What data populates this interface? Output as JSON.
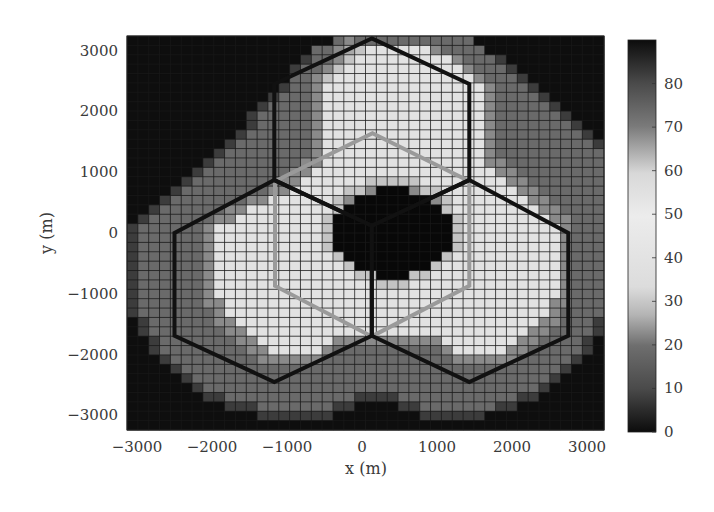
{
  "chart_data": {
    "type": "heatmap",
    "title": "",
    "xlabel": "x (m)",
    "ylabel": "y (m)",
    "xlim": [
      -3200,
      3200
    ],
    "ylim": [
      -3200,
      3200
    ],
    "x_ticks": [
      -3000,
      -2000,
      -1000,
      0,
      1000,
      2000,
      3000
    ],
    "y_ticks": [
      -3000,
      -2000,
      -1000,
      0,
      1000,
      2000,
      3000
    ],
    "x_tick_labels": [
      "−3000",
      "−2000",
      "−1000",
      "0",
      "1000",
      "2000",
      "3000"
    ],
    "y_tick_labels": [
      "−3000",
      "−2000",
      "−1000",
      "0",
      "1000",
      "2000",
      "3000"
    ],
    "grid": true,
    "colorbar": {
      "min": 0,
      "max": 90,
      "ticks": [
        0,
        10,
        20,
        30,
        40,
        50,
        60,
        70,
        80
      ],
      "tick_labels": [
        "0",
        "10",
        "20",
        "30",
        "40",
        "50",
        "60",
        "70",
        "80"
      ],
      "colormap_description": "dark at 0, gray at 10-20, light at 30-60, gray at 70-80, dark at 90"
    },
    "grid_size": {
      "cols": 44,
      "rows": 42
    },
    "cell_value_legend": {
      "0": 0,
      "1": 8,
      "2": 14,
      "3": 20,
      "4": 26,
      "5": 35,
      "6": 45,
      "7": 55,
      "8": 72,
      "9": 90
    },
    "cell_rows_top_to_bottom": [
      "00000000000000000002322222222222000000000000",
      "00000000000000000223456666663222200000000000",
      "00000000000000001223566666666632221000000000",
      "00000000000000012235666666666663222100000000",
      "00000000000000022356666666666666322210000000",
      "00000000000000122366666666666666632221000000",
      "00000000000001222366666666666666632222100000",
      "00000000000012222366666666666666632222210000",
      "00000000000122222366666666666666632222221000",
      "00000000000122222366666666666666632222222100",
      "00000000001222222366666666666666632222222210",
      "00000000012222222366666666666666632222222221",
      "00000000122222222366666666666666632222222222",
      "00000001222222223366666666666666633222222222",
      "00000012222222233666666666666666663322222222",
      "00000122222222336666665555566666666332222222",
      "00001222222223366666553999355666666633222222",
      "00012222222336666665399999993566666663322222",
      "00122222233666666665999999999566666666332222",
      "01222222336666666659999999999956666666633222",
      "12222223666666666659999999999956666666663222",
      "12222223666666666659999999999956666666663222",
      "12222223666666666659999999999956666666663222",
      "12222223666666666665999999999566666666663222",
      "12222223666666666666599999995666666666663222",
      "12222223666666666666655999556666666666663222",
      "12222223666666666666666555666666666666663222",
      "12222223666666666666666666666666666666663222",
      "12222223366666666666666666666666666666633222",
      "12222222366666666666666666666666666666632222",
      "01222222336666666666666666666666666666332221",
      "01222222233666666666666666666666666663322221",
      "00122222223366666663333333333666666633222210",
      "00122222222336666632222222222366666332222210",
      "00012222222233333322222222222233333322222100",
      "00001222222222222222222222222222222222221000",
      "00000122222222222222222222222222222222210000",
      "00000012222222222222222222222222222222100000",
      "00000001122222222222211112222222222211000000",
      "00000000011122222221100001122222221100000000",
      "00000000000011111110000000011111100000000000",
      "00000000000000000000000000000000000000000000"
    ],
    "overlays": {
      "black_hexagons_m": [
        {
          "name": "top",
          "vertices": [
            [
              130,
              3200
            ],
            [
              1430,
              2450
            ],
            [
              1430,
              870
            ],
            [
              130,
              120
            ],
            [
              -1170,
              870
            ],
            [
              -1170,
              2450
            ]
          ]
        },
        {
          "name": "left",
          "vertices": [
            [
              -1170,
              870
            ],
            [
              130,
              120
            ],
            [
              130,
              -1690
            ],
            [
              -1170,
              -2450
            ],
            [
              -2500,
              -1690
            ],
            [
              -2500,
              0
            ]
          ]
        },
        {
          "name": "right",
          "vertices": [
            [
              1430,
              870
            ],
            [
              2750,
              0
            ],
            [
              2750,
              -1690
            ],
            [
              1430,
              -2450
            ],
            [
              130,
              -1690
            ],
            [
              130,
              120
            ]
          ]
        }
      ],
      "gray_hexagon_m": {
        "vertices": [
          [
            140,
            1640
          ],
          [
            1430,
            850
          ],
          [
            1430,
            -870
          ],
          [
            130,
            -1700
          ],
          [
            -1160,
            -870
          ],
          [
            -1160,
            850
          ]
        ]
      }
    }
  },
  "colorbar_stops": [
    {
      "offset": 0.0,
      "color": "#0c0c0c"
    },
    {
      "offset": 0.11,
      "color": "#4a4a4a"
    },
    {
      "offset": 0.22,
      "color": "#6e6e6e"
    },
    {
      "offset": 0.3,
      "color": "#b5b5b5"
    },
    {
      "offset": 0.37,
      "color": "#dcdcdc"
    },
    {
      "offset": 0.55,
      "color": "#ececec"
    },
    {
      "offset": 0.66,
      "color": "#d8d8d8"
    },
    {
      "offset": 0.78,
      "color": "#7a7a7a"
    },
    {
      "offset": 0.89,
      "color": "#4a4a4a"
    },
    {
      "offset": 1.0,
      "color": "#0c0c0c"
    }
  ],
  "level_colors": {
    "0": "#0e0e0e",
    "1": "#3c3c3c",
    "2": "#6a6a6a",
    "3": "#8a8a8a",
    "4": "#a8a8a8",
    "5": "#c4c4c4",
    "6": "#e2e2e2",
    "7": "#ececec",
    "8": "#7a7a7a",
    "9": "#080808"
  }
}
